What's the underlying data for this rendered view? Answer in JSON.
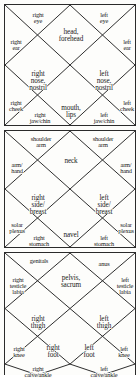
{
  "diagram": {
    "stroke_color": "#2b2b2b",
    "background_color": "#fdfdfb",
    "text_color": "#1a1a1a"
  },
  "blocks": [
    {
      "name": "head",
      "centers": [
        {
          "id": "head-forehead",
          "text": "head,\nforehead"
        },
        {
          "id": "right-nose-nostril",
          "text": "right\nnose,\nnostril"
        },
        {
          "id": "left-nose-nostril",
          "text": "left\nnose,\nnostril"
        },
        {
          "id": "mouth-lips",
          "text": "mouth,\nlips"
        }
      ],
      "edges": [
        {
          "id": "right-eye",
          "text": "right\neye"
        },
        {
          "id": "left-eye",
          "text": "left\neye"
        },
        {
          "id": "right-ear",
          "text": "right\near"
        },
        {
          "id": "left-ear",
          "text": "left\near"
        },
        {
          "id": "right-cheek",
          "text": "right\ncheek"
        },
        {
          "id": "left-cheek",
          "text": "left\ncheek"
        },
        {
          "id": "right-jaw-chin",
          "text": "right\njaw/chin"
        },
        {
          "id": "left-jaw-chin",
          "text": "left\njaw/chin"
        }
      ]
    },
    {
      "name": "torso",
      "centers": [
        {
          "id": "neck",
          "text": "neck"
        },
        {
          "id": "right-side-breast",
          "text": "right\nside/\nbreast"
        },
        {
          "id": "left-side-breast",
          "text": "left\nside/\nbreast"
        },
        {
          "id": "navel",
          "text": "navel"
        }
      ],
      "edges": [
        {
          "id": "right-shoulder-arm",
          "text": "shoulder\narm"
        },
        {
          "id": "left-shoulder-arm",
          "text": "shoulder\narm"
        },
        {
          "id": "right-arm-hand",
          "text": "arm/\nhand"
        },
        {
          "id": "left-arm-hand",
          "text": "arm/\nhand"
        },
        {
          "id": "right-solar-plexus",
          "text": "solar\nplexus"
        },
        {
          "id": "left-solar-plexus",
          "text": "solar\nplexus"
        },
        {
          "id": "right-stomach",
          "text": "right\nstomach"
        },
        {
          "id": "left-stomach",
          "text": "left\nstomach"
        }
      ]
    },
    {
      "name": "pelvis-legs",
      "centers": [
        {
          "id": "pelvis-sacrum",
          "text": "pelvis,\nsacrum"
        },
        {
          "id": "right-thigh",
          "text": "right\nthigh"
        },
        {
          "id": "left-thigh",
          "text": "left\nthigh"
        },
        {
          "id": "right-foot",
          "text": "right\nfoot"
        },
        {
          "id": "left-foot",
          "text": "left\nfoot"
        }
      ],
      "edges": [
        {
          "id": "genitals",
          "text": "genitals"
        },
        {
          "id": "anus",
          "text": "anus"
        },
        {
          "id": "right-testicle-labia",
          "text": "right\ntesticle\nlabia"
        },
        {
          "id": "left-testicle-labia",
          "text": "left\ntesticle\nlabia"
        },
        {
          "id": "right-knee",
          "text": "right\nknee"
        },
        {
          "id": "left-knee",
          "text": "left\nknee"
        },
        {
          "id": "right-calve-ankle",
          "text": "right\ncalve/ankle"
        },
        {
          "id": "left-calve-ankle",
          "text": "left\ncalve/ankle"
        }
      ]
    }
  ]
}
